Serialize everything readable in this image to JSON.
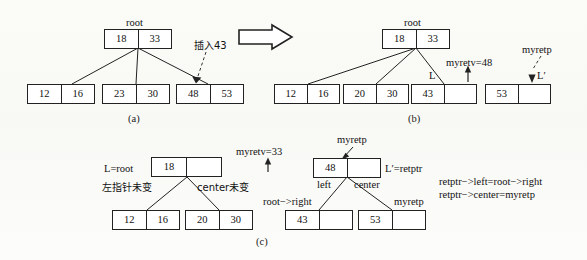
{
  "figure": {
    "caption_a": "(a)",
    "caption_b": "(b)",
    "caption_c": "(c)"
  },
  "panel_a": {
    "root_label": "root",
    "root_node": [
      "18",
      "33"
    ],
    "leaves": [
      [
        "12",
        "16"
      ],
      [
        "23",
        "30"
      ],
      [
        "48",
        "53"
      ]
    ],
    "insert_note": "插入43"
  },
  "transition": {
    "arrow_icon": "block-arrow-right"
  },
  "panel_b": {
    "root_label": "root",
    "root_node": [
      "18",
      "33"
    ],
    "leaves": [
      [
        "12",
        "16"
      ],
      [
        "20",
        "30"
      ],
      [
        "43",
        ""
      ],
      [
        "53",
        ""
      ]
    ],
    "label_L": "L",
    "label_Lprime": "L′",
    "myretv": "myretv=48",
    "myretp": "myretp"
  },
  "panel_c": {
    "left": {
      "L_eq_root": "L=root",
      "node": [
        "18",
        ""
      ],
      "note_left_ptr": "左指针未变",
      "note_center": "center未变",
      "leaves": [
        [
          "12",
          "16"
        ],
        [
          "20",
          "30"
        ]
      ],
      "myretv": "myretv=33"
    },
    "right": {
      "myretp_top": "myretp",
      "node": [
        "48",
        ""
      ],
      "Lprime_eq_retptr": "L′=retptr",
      "label_left": "left",
      "label_center": "center",
      "label_root_right": "root−>right",
      "label_myretp": "myretp",
      "leaves": [
        [
          "43",
          ""
        ],
        [
          "53",
          ""
        ]
      ],
      "code_line1": "retptr−>left=root−>right",
      "code_line2": "retptr−>center=myretp"
    }
  },
  "colors": {
    "ink": "#111111",
    "paper": "#fdfdfb",
    "stroke": "#222222"
  }
}
